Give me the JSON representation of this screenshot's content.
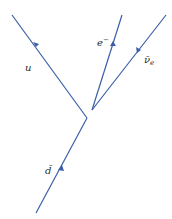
{
  "diagram": {
    "type": "feynman-diagram",
    "line_color": "#3a5fa8",
    "label_color": "#2b2b2b",
    "vertices": [
      {
        "id": "v1",
        "x": 87,
        "y": 118
      },
      {
        "id": "v2",
        "x": 92,
        "y": 110
      }
    ],
    "particles": [
      {
        "id": "u",
        "label": "u",
        "from": [
          87,
          118
        ],
        "to": [
          12,
          15
        ],
        "arrow_at": [
          36,
          47
        ],
        "label_pos": [
          28,
          67
        ]
      },
      {
        "id": "electron",
        "label": "e",
        "superscript": "−",
        "from": [
          92,
          110
        ],
        "to": [
          122,
          15
        ],
        "arrow_at": [
          112,
          43
        ],
        "label_pos": [
          98,
          45
        ]
      },
      {
        "id": "antineutrino",
        "label": "ν̄",
        "subscript": "e",
        "from": [
          166,
          15
        ],
        "to": [
          92,
          110
        ],
        "arrow_at": [
          139,
          49
        ],
        "label_pos": [
          145,
          60
        ]
      },
      {
        "id": "d",
        "label": "d̄",
        "from": [
          36,
          213
        ],
        "to": [
          87,
          118
        ],
        "arrow_at": [
          61,
          168
        ],
        "label_pos": [
          47,
          171
        ]
      }
    ]
  }
}
